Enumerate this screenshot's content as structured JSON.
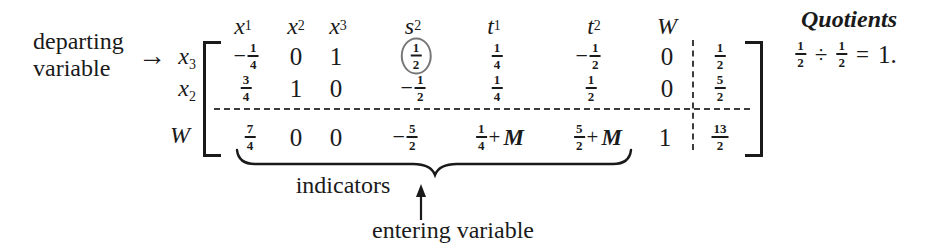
{
  "colors": {
    "ink": "#1a1a1a",
    "pivot_circle": "#777777",
    "background": "#ffffff"
  },
  "annotations": {
    "departing": {
      "line1": "departing",
      "line2": "variable",
      "arrow": "→"
    },
    "indicators": {
      "label": "indicators"
    },
    "entering": {
      "label": "entering variable"
    },
    "quotients": {
      "title": "Quotients",
      "lhs_num": "1",
      "lhs_den": "2",
      "op": "÷",
      "rhs_num": "1",
      "rhs_den": "2",
      "equals": "=",
      "result": "1."
    }
  },
  "tableau": {
    "col_headers": [
      {
        "base": "x",
        "sub": "1"
      },
      {
        "base": "x",
        "sub": "2"
      },
      {
        "base": "x",
        "sub": "3"
      },
      {
        "base": "s",
        "sub": "2"
      },
      {
        "base": "t",
        "sub": "1"
      },
      {
        "base": "t",
        "sub": "2"
      },
      {
        "base": "W",
        "sub": ""
      }
    ],
    "row_labels": [
      {
        "base": "x",
        "sub": "3"
      },
      {
        "base": "x",
        "sub": "2"
      },
      {
        "base": "W",
        "sub": ""
      }
    ],
    "rows": [
      {
        "cells": [
          {
            "sign": "−",
            "num": "1",
            "den": "4"
          },
          {
            "value": "0"
          },
          {
            "value": "1"
          },
          {
            "num": "1",
            "den": "2",
            "circled": true
          },
          {
            "num": "1",
            "den": "4"
          },
          {
            "sign": "−",
            "num": "1",
            "den": "2"
          },
          {
            "value": "0"
          }
        ],
        "rhs": {
          "num": "1",
          "den": "2"
        }
      },
      {
        "cells": [
          {
            "num": "3",
            "den": "4"
          },
          {
            "value": "1"
          },
          {
            "value": "0"
          },
          {
            "sign": "−",
            "num": "1",
            "den": "2"
          },
          {
            "num": "1",
            "den": "4"
          },
          {
            "num": "1",
            "den": "2"
          },
          {
            "value": "0"
          }
        ],
        "rhs": {
          "num": "5",
          "den": "2"
        }
      },
      {
        "cells": [
          {
            "num": "7",
            "den": "4"
          },
          {
            "value": "0"
          },
          {
            "value": "0"
          },
          {
            "sign": "−",
            "num": "5",
            "den": "2"
          },
          {
            "num": "1",
            "den": "4",
            "plus": "+",
            "pvar": "M"
          },
          {
            "num": "5",
            "den": "2",
            "plus": "+",
            "pvar": "M"
          },
          {
            "value": "1"
          }
        ],
        "rhs": {
          "num": "13",
          "den": "2"
        }
      }
    ]
  }
}
